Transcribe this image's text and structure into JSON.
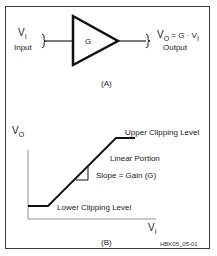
{
  "diagram": {
    "panel_a": {
      "label": "(A)",
      "input": {
        "symbol": "V",
        "subscript": "I",
        "caption": "Input"
      },
      "amplifier": {
        "label": "G"
      },
      "output": {
        "symbol": "V",
        "subscript": "O",
        "equation_mid": " = G · V",
        "equation_sub": "I",
        "caption": "Output"
      }
    },
    "panel_b": {
      "label": "(B)",
      "y_axis": {
        "symbol": "V",
        "subscript": "O"
      },
      "x_axis": {
        "symbol": "V",
        "subscript": "I"
      },
      "annotations": {
        "upper": "Upper Clipping Level",
        "linear": "Linear Portion",
        "slope": "Slope = Gain (G)",
        "lower": "Lower Clipping Level"
      }
    },
    "figure_id": "HBK05_05-01",
    "colors": {
      "line": "#111111",
      "frame": "#3a3a3a",
      "background": "#ffffff"
    }
  }
}
